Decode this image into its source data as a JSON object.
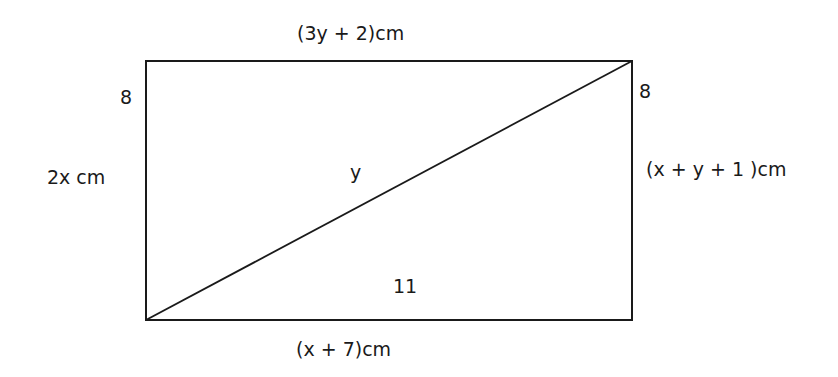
{
  "figure": {
    "type": "rectangle-with-diagonal",
    "stroke_color": "#1a1a1a",
    "background": "#ffffff",
    "rectangle": {
      "x": 146,
      "y": 61,
      "width": 486,
      "height": 259
    },
    "diagonal": {
      "from": "bottom-left",
      "to": "top-right"
    }
  },
  "labels": {
    "top_side": "(3y + 2)cm",
    "bottom_side": "(x + 7)cm",
    "left_side": "2x cm",
    "right_side": "(x + y  + 1 )cm",
    "top_left_corner": "8",
    "top_right_corner": "8",
    "diagonal_upper": "y",
    "lower_triangle": "11"
  }
}
